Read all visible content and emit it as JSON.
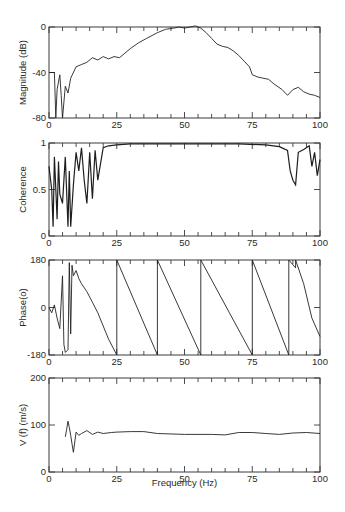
{
  "chart_data": [
    {
      "type": "line",
      "title": "",
      "xlabel": "",
      "ylabel": "Magnitude (dB)",
      "xlim": [
        0,
        100
      ],
      "ylim": [
        -80,
        0
      ],
      "xticks": [
        0,
        25,
        50,
        75,
        100
      ],
      "yticks": [
        0,
        -40,
        -80
      ],
      "grid": false,
      "x": [
        0,
        2,
        2.5,
        3,
        4,
        4.5,
        5,
        6,
        7,
        8,
        10,
        12,
        14,
        16,
        18,
        20,
        22,
        24,
        26,
        28,
        30,
        33,
        36,
        40,
        43,
        46,
        48,
        50,
        52,
        54,
        56,
        58,
        60,
        62,
        64,
        66,
        68,
        70,
        72,
        74,
        75,
        77,
        79,
        81,
        83,
        86,
        88,
        90,
        92,
        94,
        96,
        98,
        100
      ],
      "values": [
        -40,
        -40,
        -80,
        -55,
        -42,
        -60,
        -80,
        -52,
        -58,
        -45,
        -35,
        -33,
        -31,
        -27,
        -29,
        -26,
        -28,
        -26,
        -27,
        -23,
        -19,
        -14,
        -10,
        -5,
        -2,
        -1,
        0,
        -1,
        0,
        1,
        -1,
        -5,
        -10,
        -15,
        -17,
        -18,
        -21,
        -25,
        -30,
        -35,
        -42,
        -44,
        -45,
        -46,
        -50,
        -55,
        -60,
        -55,
        -53,
        -57,
        -59,
        -60,
        -62
      ]
    },
    {
      "type": "line",
      "title": "",
      "xlabel": "",
      "ylabel": "Coherence",
      "xlim": [
        0,
        100
      ],
      "ylim": [
        0,
        1
      ],
      "xticks": [
        0,
        25,
        50,
        75,
        100
      ],
      "yticks": [
        0,
        0.5,
        1
      ],
      "grid": false,
      "x": [
        0,
        1,
        1.5,
        2,
        3,
        3.5,
        4,
        5,
        6,
        7,
        7.5,
        8,
        9,
        10,
        11,
        12,
        13,
        14,
        15,
        16,
        17,
        18,
        20,
        22,
        25,
        30,
        40,
        55,
        60,
        70,
        80,
        85,
        88,
        89,
        90,
        91,
        92,
        94,
        96,
        97,
        98,
        99,
        100
      ],
      "values": [
        0.75,
        0.5,
        0.1,
        0.85,
        0.18,
        0.8,
        0.45,
        0.35,
        0.85,
        0.1,
        0.7,
        0.1,
        0.55,
        0.9,
        0.7,
        0.95,
        0.6,
        0.35,
        0.9,
        0.4,
        0.92,
        0.6,
        0.95,
        0.97,
        0.98,
        0.99,
        0.99,
        0.99,
        0.99,
        0.99,
        0.98,
        0.96,
        0.92,
        0.7,
        0.6,
        0.55,
        0.9,
        0.93,
        0.97,
        0.75,
        0.9,
        0.65,
        0.82
      ]
    },
    {
      "type": "line",
      "title": "",
      "xlabel": "",
      "ylabel": "Phase(o)",
      "xlim": [
        0,
        100
      ],
      "ylim": [
        -180,
        180
      ],
      "xticks": [
        0,
        25,
        50,
        75,
        100
      ],
      "yticks": [
        180,
        0,
        -180
      ],
      "grid": false,
      "x": [
        0,
        1,
        2,
        3,
        4,
        5,
        5.5,
        6,
        7,
        7.5,
        8,
        8.5,
        9,
        10,
        11,
        12,
        14,
        16,
        18,
        20,
        22,
        25,
        25.01,
        40,
        40.01,
        56,
        56.01,
        75,
        75.01,
        88.5,
        88.5,
        91,
        91,
        94,
        97,
        100
      ],
      "values": [
        0,
        -20,
        10,
        -40,
        -80,
        120,
        -140,
        -170,
        -160,
        170,
        -100,
        160,
        120,
        140,
        110,
        90,
        60,
        20,
        -20,
        -70,
        -120,
        -180,
        180,
        -180,
        180,
        -180,
        180,
        -180,
        180,
        -180,
        180,
        150,
        180,
        90,
        -40,
        -110
      ]
    },
    {
      "type": "line",
      "title": "",
      "xlabel": "Frequency (Hz)",
      "ylabel": "V (f) (m/s)",
      "xlim": [
        0,
        100
      ],
      "ylim": [
        0,
        200
      ],
      "xticks": [
        0,
        25,
        50,
        75,
        100
      ],
      "yticks": [
        0,
        100,
        200
      ],
      "grid": false,
      "x": [
        6,
        6.5,
        7,
        7.5,
        8,
        8.5,
        9,
        10,
        11,
        12,
        14,
        16,
        18,
        20,
        23,
        25,
        30,
        35,
        40,
        50,
        60,
        65,
        70,
        75,
        80,
        85,
        90,
        95,
        100
      ],
      "values": [
        75,
        90,
        108,
        95,
        78,
        60,
        42,
        85,
        78,
        82,
        88,
        80,
        85,
        82,
        84,
        85,
        86,
        86,
        82,
        80,
        80,
        79,
        84,
        84,
        82,
        80,
        83,
        84,
        82
      ]
    }
  ],
  "panels": [
    {
      "ylabel": "Magnitude (dB)",
      "yticks": [
        "0",
        "-40",
        "-80"
      ],
      "xticks": [
        "0",
        "25",
        "50",
        "75",
        "100"
      ]
    },
    {
      "ylabel": "Coherence",
      "yticks": [
        "1",
        "0.5",
        "0"
      ],
      "xticks": [
        "0",
        "25",
        "50",
        "75",
        "100"
      ]
    },
    {
      "ylabel": "Phase(o)",
      "yticks": [
        "180",
        "0",
        "-180"
      ],
      "xticks": [
        "0",
        "25",
        "50",
        "75",
        "100"
      ]
    },
    {
      "ylabel": "V (f) (m/s)",
      "yticks": [
        "200",
        "100",
        "0"
      ],
      "xticks": [
        "0",
        "25",
        "50",
        "75",
        "100"
      ]
    }
  ],
  "xlabel": "Frequency (Hz)"
}
